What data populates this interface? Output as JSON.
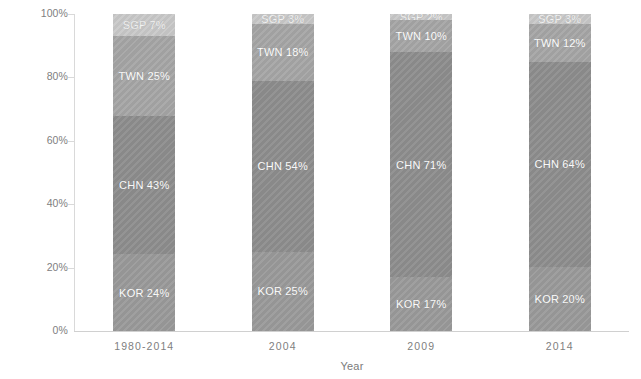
{
  "chart_data": {
    "type": "bar",
    "subtype": "stacked-100-percent",
    "title": "",
    "xlabel": "Year",
    "ylabel": "Percent share",
    "categories": [
      "1980-2014",
      "2004",
      "2009",
      "2014"
    ],
    "ylim": [
      0,
      100
    ],
    "ytick_labels": [
      "0%",
      "20%",
      "40%",
      "60%",
      "80%",
      "100%"
    ],
    "ytick_values": [
      0,
      20,
      40,
      60,
      80,
      100
    ],
    "grid": false,
    "legend": "none",
    "stack_order_bottom_to_top": [
      "KOR",
      "CHN",
      "TWN",
      "SGP"
    ],
    "series": [
      {
        "name": "KOR",
        "color": "#9a9a9a",
        "values": [
          24,
          25,
          17,
          20
        ]
      },
      {
        "name": "CHN",
        "color": "#8e8e8e",
        "values": [
          43,
          54,
          71,
          64
        ]
      },
      {
        "name": "TWN",
        "color": "#a6a6a6",
        "values": [
          25,
          18,
          10,
          12
        ]
      },
      {
        "name": "SGP",
        "color": "#c9c9c9",
        "values": [
          7,
          3,
          2,
          3
        ]
      }
    ],
    "bar_labels": [
      [
        "KOR 24%",
        "CHN 43%",
        "TWN 25%",
        "SGP 7%"
      ],
      [
        "KOR 25%",
        "CHN 54%",
        "TWN 18%",
        "SGP 3%"
      ],
      [
        "KOR 17%",
        "CHN 71%",
        "TWN 10%",
        "SGP 2%"
      ],
      [
        "KOR 20%",
        "CHN 64%",
        "TWN 12%",
        "SGP 3%"
      ]
    ],
    "axis_color": "#d9d9d9",
    "tick_text_color": "#808080",
    "label_text_color": "#ffffff",
    "background": "#ffffff"
  },
  "axes": {
    "y_title": "Percent share",
    "x_title": "Year"
  }
}
